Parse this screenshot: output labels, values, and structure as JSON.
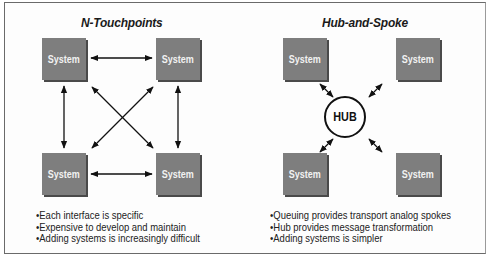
{
  "left_panel": {
    "title": "N-Touchpoints",
    "systems": [
      "System",
      "System",
      "System",
      "System"
    ],
    "bullets": [
      "Each interface is specific",
      "Expensive to develop and maintain",
      "Adding systems is increasingly difficult"
    ]
  },
  "right_panel": {
    "title": "Hub-and-Spoke",
    "hub_label": "HUB",
    "systems": [
      "System",
      "System",
      "System",
      "System"
    ],
    "bullets": [
      "Queuing provides transport analog spokes",
      "Hub provides message transformation",
      "Adding systems is simpler"
    ]
  },
  "colors": {
    "system_box": "#7e7e7e",
    "system_shadow": "#4a4a4a",
    "system_text": "#f2f2f2",
    "arrow": "#111111",
    "frame_border": "#6a6a6a"
  }
}
